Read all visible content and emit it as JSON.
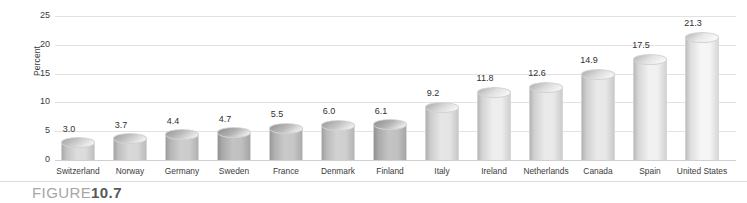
{
  "figure": {
    "label": "FIGURE",
    "number": "10.7"
  },
  "chart_data": {
    "type": "bar",
    "title": "",
    "subtitle": "",
    "xlabel": "",
    "ylabel": "Percent",
    "ylim": [
      0,
      25
    ],
    "yticks": [
      0,
      5,
      10,
      15,
      20,
      25
    ],
    "ytick_labels": [
      "0",
      "5",
      "10",
      "15",
      "20",
      "25"
    ],
    "grid": true,
    "legend": "none",
    "orientation": "vertical",
    "bar_style": "3d-cylinder",
    "categories": [
      "Switzerland",
      "Norway",
      "Germany",
      "Sweden",
      "France",
      "Denmark",
      "Finland",
      "Italy",
      "Ireland",
      "Netherlands",
      "Canada",
      "Spain",
      "United States"
    ],
    "values": [
      3.0,
      3.7,
      4.4,
      4.7,
      5.5,
      6.0,
      6.1,
      9.2,
      11.8,
      12.6,
      14.9,
      17.5,
      21.3
    ],
    "value_labels": [
      "3.0",
      "3.7",
      "4.4",
      "4.7",
      "5.5",
      "6.0",
      "6.1",
      "9.2",
      "11.8",
      "12.6",
      "14.9",
      "17.5",
      "21.3"
    ],
    "bar_shades": [
      "#d9d9d9",
      "#d4d4d4",
      "#c9c9c9",
      "#bcbcbc",
      "#c4c4c4",
      "#cdcdcd",
      "#bdbdbd",
      "#e3e3e3",
      "#ececec",
      "#e8e8e8",
      "#e6e6e6",
      "#efefef",
      "#f5f5f5"
    ]
  },
  "colors": {
    "background": "#ffffff",
    "gridline": "#e2e2e2",
    "baseline": "#cfcfcf",
    "text": "#3b3b3b",
    "caption_label": "#a6a6a6",
    "caption_number": "#595959"
  }
}
